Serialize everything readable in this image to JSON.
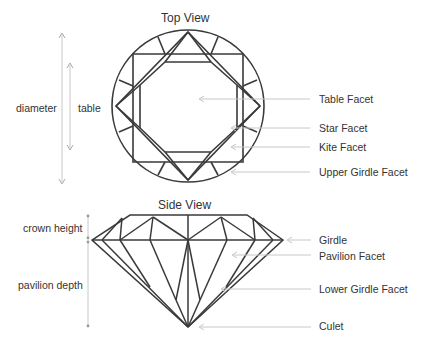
{
  "top_view": {
    "title": "Top View",
    "dimensions": {
      "diameter": "diameter",
      "table": "table"
    },
    "callouts": [
      "Table Facet",
      "Star Facet",
      "Kite Facet",
      "Upper Girdle Facet"
    ]
  },
  "side_view": {
    "title": "Side View",
    "dimensions": {
      "crown_height": "crown height",
      "pavilion_depth": "pavilion depth"
    },
    "callouts": [
      "Girdle",
      "Pavilion Facet",
      "Lower Girdle Facet",
      "Culet"
    ]
  },
  "colors": {
    "outline": "#3a3a3a",
    "guide": "#c8c8c8",
    "text": "#333333"
  }
}
